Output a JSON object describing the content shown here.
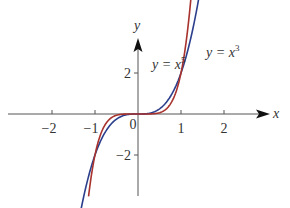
{
  "chart_data": {
    "type": "line",
    "title": "",
    "xlabel": "x",
    "ylabel": "y",
    "xlim": [
      -3.0,
      3.0
    ],
    "ylim": [
      -3.0,
      3.0
    ],
    "x_ticks": [
      -2,
      -1,
      0,
      1,
      2
    ],
    "x_tick_labels": [
      "−2",
      "−1",
      "0",
      "1",
      "2"
    ],
    "y_ticks": [
      2,
      -2
    ],
    "y_tick_labels": [
      "2",
      "−2"
    ],
    "grid": false,
    "series": [
      {
        "name": "y = x^3",
        "label_text": "y = x",
        "label_exp": "3",
        "color": "#2b3f8c",
        "x": [
          -1.44,
          -1.2,
          -1.0,
          -0.8,
          -0.6,
          -0.4,
          -0.2,
          0,
          0.2,
          0.4,
          0.6,
          0.8,
          1.0,
          1.2,
          1.4,
          1.56
        ],
        "values": [
          -2.99,
          -1.73,
          -1.0,
          -0.51,
          -0.22,
          -0.06,
          -0.01,
          0,
          0.01,
          0.06,
          0.22,
          0.51,
          1.0,
          1.73,
          2.74,
          3.8
        ]
      },
      {
        "name": "y = x^5",
        "label_text": "y = x",
        "label_exp": "5",
        "color": "#a8322d",
        "x": [
          -1.15,
          -1.0,
          -0.9,
          -0.8,
          -0.6,
          -0.4,
          -0.2,
          0,
          0.2,
          0.4,
          0.6,
          0.8,
          0.9,
          1.0,
          1.1,
          1.2,
          1.3
        ],
        "values": [
          -2.01,
          -1.0,
          -0.59,
          -0.33,
          -0.08,
          -0.01,
          0,
          0,
          0,
          0.01,
          0.08,
          0.33,
          0.59,
          1.0,
          1.61,
          2.49,
          3.71
        ]
      }
    ],
    "legend": "inline labels near curves, upper right"
  },
  "axes": {
    "x_label": "x",
    "y_label": "y",
    "origin_label": "0"
  },
  "labels": {
    "x5": {
      "base": "y = x",
      "exp": "5"
    },
    "x3": {
      "base": "y = x",
      "exp": "3"
    }
  }
}
